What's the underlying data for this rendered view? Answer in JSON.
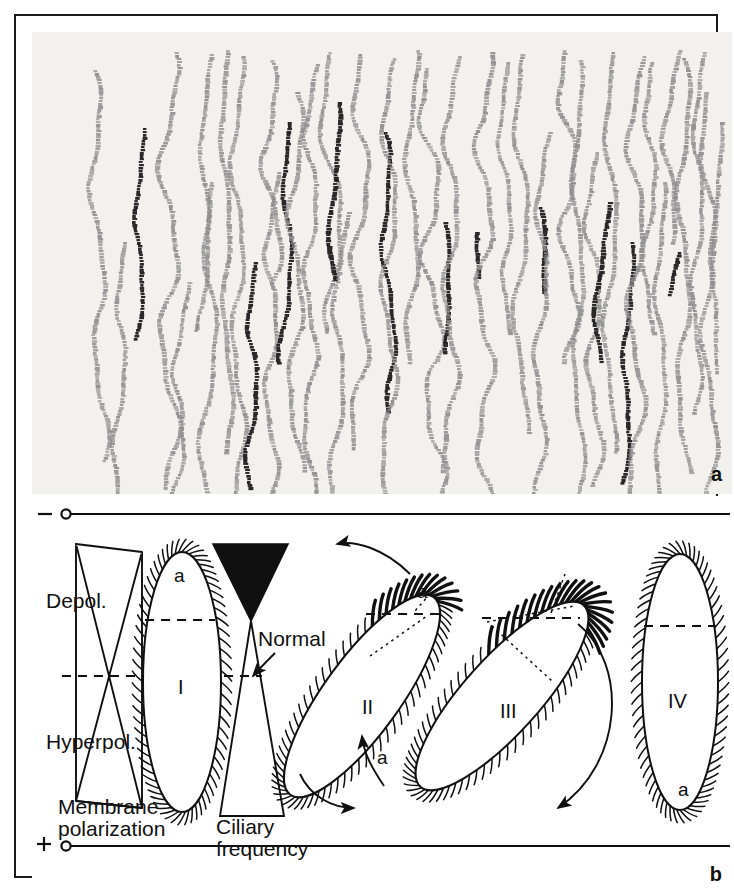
{
  "figure": {
    "panels": [
      {
        "id": "a",
        "letter": "a",
        "caption_letter": "a",
        "type": "micrograph",
        "description": "dark-field photomicrograph showing swimming tracks of ciliate cells"
      },
      {
        "id": "b",
        "letter": "b",
        "caption_letter": "b",
        "type": "schematic",
        "description": "schematic of membrane polarization, ciliary frequency and ciliary beat orientation"
      }
    ]
  },
  "panel_a": {
    "letter": "a",
    "background_color": "#f2f1ee",
    "track_color_light": "#8d8d8d",
    "track_color_dark": "#1d1d1d",
    "track_count": 46,
    "tracks": [
      {
        "x": 62,
        "amp": 6,
        "phase": 0.2,
        "top": 38,
        "bottom": 430,
        "w": 4.2,
        "dark": false
      },
      {
        "x": 108,
        "amp": 4,
        "phase": 1.1,
        "top": 96,
        "bottom": 308,
        "w": 4.0,
        "dark": true
      },
      {
        "x": 137,
        "amp": 9,
        "phase": 0.6,
        "top": 20,
        "bottom": 455,
        "w": 4.4,
        "dark": false
      },
      {
        "x": 176,
        "amp": 5,
        "phase": 2.1,
        "top": 22,
        "bottom": 300,
        "w": 4.0,
        "dark": false
      },
      {
        "x": 181,
        "amp": 7,
        "phase": 3.0,
        "top": 150,
        "bottom": 460,
        "w": 4.2,
        "dark": false
      },
      {
        "x": 192,
        "amp": 4,
        "phase": 1.7,
        "top": 18,
        "bottom": 420,
        "w": 4.4,
        "dark": false
      },
      {
        "x": 205,
        "amp": 6,
        "phase": 0.9,
        "top": 24,
        "bottom": 462,
        "w": 4.0,
        "dark": false
      },
      {
        "x": 222,
        "amp": 5,
        "phase": 2.4,
        "top": 230,
        "bottom": 455,
        "w": 4.2,
        "dark": true
      },
      {
        "x": 236,
        "amp": 8,
        "phase": 0.4,
        "top": 28,
        "bottom": 250,
        "w": 4.4,
        "dark": false
      },
      {
        "x": 240,
        "amp": 6,
        "phase": 1.3,
        "top": 140,
        "bottom": 462,
        "w": 4.2,
        "dark": false
      },
      {
        "x": 258,
        "amp": 5,
        "phase": 2.8,
        "top": 90,
        "bottom": 330,
        "w": 4.0,
        "dark": true
      },
      {
        "x": 264,
        "amp": 7,
        "phase": 0.1,
        "top": 60,
        "bottom": 440,
        "w": 4.4,
        "dark": false
      },
      {
        "x": 280,
        "amp": 6,
        "phase": 1.9,
        "top": 32,
        "bottom": 462,
        "w": 4.2,
        "dark": false
      },
      {
        "x": 296,
        "amp": 9,
        "phase": 2.6,
        "top": 20,
        "bottom": 300,
        "w": 4.0,
        "dark": false
      },
      {
        "x": 303,
        "amp": 5,
        "phase": 0.7,
        "top": 70,
        "bottom": 248,
        "w": 4.4,
        "dark": true
      },
      {
        "x": 310,
        "amp": 6,
        "phase": 1.5,
        "top": 180,
        "bottom": 462,
        "w": 4.2,
        "dark": false
      },
      {
        "x": 330,
        "amp": 8,
        "phase": 3.1,
        "top": 22,
        "bottom": 415,
        "w": 4.4,
        "dark": false
      },
      {
        "x": 352,
        "amp": 5,
        "phase": 0.3,
        "top": 100,
        "bottom": 380,
        "w": 4.0,
        "dark": true
      },
      {
        "x": 358,
        "amp": 7,
        "phase": 2.2,
        "top": 26,
        "bottom": 462,
        "w": 4.2,
        "dark": false
      },
      {
        "x": 380,
        "amp": 6,
        "phase": 1.0,
        "top": 18,
        "bottom": 330,
        "w": 4.4,
        "dark": false
      },
      {
        "x": 396,
        "amp": 9,
        "phase": 2.9,
        "top": 36,
        "bottom": 462,
        "w": 4.2,
        "dark": false
      },
      {
        "x": 410,
        "amp": 5,
        "phase": 0.5,
        "top": 190,
        "bottom": 320,
        "w": 4.0,
        "dark": true
      },
      {
        "x": 420,
        "amp": 7,
        "phase": 1.6,
        "top": 24,
        "bottom": 440,
        "w": 4.4,
        "dark": false
      },
      {
        "x": 442,
        "amp": 6,
        "phase": 2.3,
        "top": 200,
        "bottom": 245,
        "w": 4.2,
        "dark": true
      },
      {
        "x": 452,
        "amp": 8,
        "phase": 0.8,
        "top": 20,
        "bottom": 462,
        "w": 4.4,
        "dark": false
      },
      {
        "x": 470,
        "amp": 5,
        "phase": 1.4,
        "top": 30,
        "bottom": 300,
        "w": 4.0,
        "dark": false
      },
      {
        "x": 490,
        "amp": 7,
        "phase": 2.7,
        "top": 22,
        "bottom": 400,
        "w": 4.2,
        "dark": false
      },
      {
        "x": 508,
        "amp": 4,
        "phase": 0.2,
        "top": 175,
        "bottom": 260,
        "w": 4.4,
        "dark": true
      },
      {
        "x": 512,
        "amp": 6,
        "phase": 1.8,
        "top": 100,
        "bottom": 462,
        "w": 4.2,
        "dark": false
      },
      {
        "x": 534,
        "amp": 8,
        "phase": 3.0,
        "top": 18,
        "bottom": 330,
        "w": 4.4,
        "dark": false
      },
      {
        "x": 545,
        "amp": 5,
        "phase": 0.6,
        "top": 28,
        "bottom": 462,
        "w": 4.0,
        "dark": false
      },
      {
        "x": 560,
        "amp": 7,
        "phase": 2.0,
        "top": 120,
        "bottom": 455,
        "w": 4.2,
        "dark": false
      },
      {
        "x": 572,
        "amp": 5,
        "phase": 1.2,
        "top": 170,
        "bottom": 330,
        "w": 4.4,
        "dark": true
      },
      {
        "x": 580,
        "amp": 6,
        "phase": 2.5,
        "top": 20,
        "bottom": 420,
        "w": 4.2,
        "dark": false
      },
      {
        "x": 598,
        "amp": 4,
        "phase": 0.4,
        "top": 210,
        "bottom": 450,
        "w": 4.0,
        "dark": true
      },
      {
        "x": 604,
        "amp": 8,
        "phase": 1.7,
        "top": 24,
        "bottom": 462,
        "w": 4.4,
        "dark": false
      },
      {
        "x": 620,
        "amp": 6,
        "phase": 2.8,
        "top": 30,
        "bottom": 300,
        "w": 4.2,
        "dark": false
      },
      {
        "x": 628,
        "amp": 5,
        "phase": 0.9,
        "top": 150,
        "bottom": 462,
        "w": 4.0,
        "dark": false
      },
      {
        "x": 640,
        "amp": 7,
        "phase": 1.5,
        "top": 18,
        "bottom": 210,
        "w": 4.4,
        "dark": false
      },
      {
        "x": 646,
        "amp": 4,
        "phase": 2.4,
        "top": 220,
        "bottom": 262,
        "w": 4.2,
        "dark": true
      },
      {
        "x": 652,
        "amp": 6,
        "phase": 0.1,
        "top": 26,
        "bottom": 440,
        "w": 4.4,
        "dark": false
      },
      {
        "x": 668,
        "amp": 5,
        "phase": 1.9,
        "top": 20,
        "bottom": 380,
        "w": 4.0,
        "dark": false
      },
      {
        "x": 676,
        "amp": 7,
        "phase": 3.1,
        "top": 60,
        "bottom": 462,
        "w": 4.2,
        "dark": false
      },
      {
        "x": 686,
        "amp": 4,
        "phase": 0.7,
        "top": 90,
        "bottom": 340,
        "w": 4.0,
        "dark": false
      },
      {
        "x": 92,
        "amp": 5,
        "phase": 2.6,
        "top": 210,
        "bottom": 462,
        "w": 4.2,
        "dark": false
      },
      {
        "x": 150,
        "amp": 6,
        "phase": 1.1,
        "top": 250,
        "bottom": 462,
        "w": 4.0,
        "dark": false
      }
    ]
  },
  "panel_b": {
    "letter": "b",
    "axis_top": {
      "sign": "–",
      "marker": "open-circle"
    },
    "axis_bottom": {
      "sign": "+",
      "marker": "open-circle"
    },
    "labels": {
      "depol": "Depol.",
      "hyperpol": "Hyperpol.",
      "membrane_polarization_line1": "Membrane",
      "membrane_polarization_line2": "polarization",
      "ciliary_line1": "Ciliary",
      "ciliary_line2": "frequency",
      "normal": "Normal"
    },
    "cells": [
      {
        "roman": "I",
        "anterior": "a",
        "name": "cell-I"
      },
      {
        "roman": "II",
        "anterior": "a",
        "name": "cell-II"
      },
      {
        "roman": "III",
        "anterior": "a",
        "name": "cell-III"
      },
      {
        "roman": "IV",
        "anterior": "a",
        "name": "cell-IV"
      }
    ],
    "colors": {
      "ink": "#101010",
      "paper": "#ffffff"
    }
  }
}
